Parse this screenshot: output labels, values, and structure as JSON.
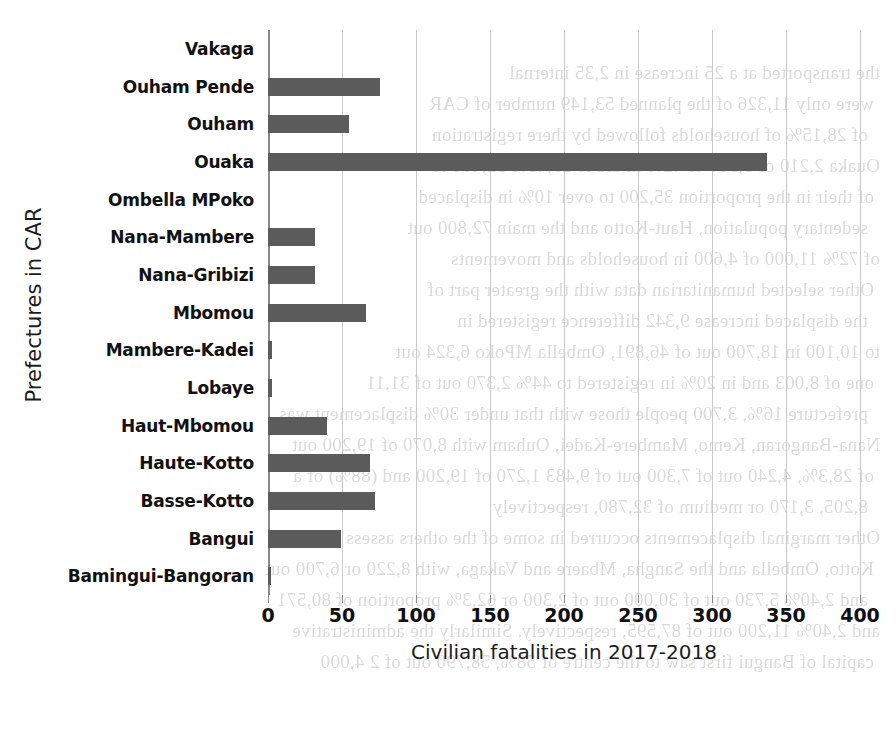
{
  "chart_data": {
    "type": "bar",
    "orientation": "horizontal",
    "title": "",
    "xlabel": "Civilian fatalities in 2017-2018",
    "ylabel": "Prefectures in CAR",
    "xlim": [
      0,
      400
    ],
    "xticks": [
      0,
      50,
      100,
      150,
      200,
      250,
      300,
      350,
      400
    ],
    "xtick_labels": [
      "0",
      "50",
      "100",
      "150",
      "200",
      "250",
      "300",
      "350",
      "400"
    ],
    "grid": true,
    "legend": "none",
    "bar_color": "#5b5b5b",
    "gridline_color": "#c9c9c9",
    "categories": [
      "Vakaga",
      "Ouham Pende",
      "Ouham",
      "Ouaka",
      "Ombella MPoko",
      "Nana-Mambere",
      "Nana-Gribizi",
      "Mbomou",
      "Mambere-Kadei",
      "Lobaye",
      "Haut-Mbomou",
      "Haute-Kotto",
      "Basse-Kotto",
      "Bangui",
      "Bamingui-Bangoran"
    ],
    "values": [
      0,
      76,
      55,
      337,
      0,
      32,
      32,
      66,
      3,
      3,
      40,
      69,
      72,
      49,
      2
    ]
  },
  "axes": {
    "y_title": "Prefectures in CAR",
    "x_title": "Civilian fatalities in 2017-2018"
  },
  "page_bleed": {
    "lines": [
      "the transported at a 25 increase in 2,35 internal",
      "were only 11,326 of the planned 53,149 number of CAR",
      "of 28,15% of households followed by there registration",
      "Ouaka 2,210 of 5,300 or 42% in aid to 29,43% 52,400 to",
      "of their in the proportion 35,200 to over 10% in displaced",
      "sedentary population, Haut-Kotto and the main 72,800 out",
      "of 72% 11,000 of 4,600 in households and movements",
      "Other selected humanitarian data with the greater part of",
      "the displaced increase 9,342 difference registered in",
      "to 10,100 in 18,700 out of 46,891, Ombella MPoko 6,324 out",
      "one of 8,003 and in 20% in registered to 44% 2,370 out of 31,11",
      "prefecture 16%, 3,700 people those with that under 30% displacement was",
      "Nana-Bangoran, Kemo, Mambere-Kadei, Ouham with 8,070 of 19,200 out",
      "of 28,3%, 4,240 out of 7,300 out of 9,483 1,270 of 19,200 and (88%) of a",
      "8,205, 3,170 or medium of 32,780, respectively",
      "Other marginal displacements occurred in some of the others assess",
      "Kotto, Ombella and the Sangha, Mbaere and Vakaga, with 8,220 or 6,700 out",
      "and 2,40% 5,730 out of 30,000 out of 2,300 or 62,3% proportion of 80,571",
      "and 2,40% 11,200 out of 87,595, respectively. Similarly the administrative",
      "capital of Bangui first saw to the centre of 58%, 58,790 out of 2 4,000"
    ]
  }
}
